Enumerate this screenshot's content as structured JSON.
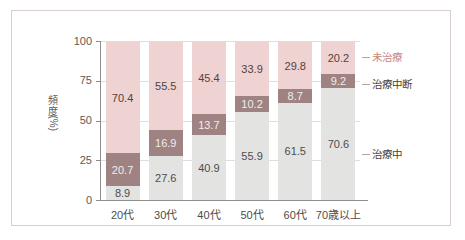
{
  "chart_data": {
    "type": "bar",
    "subtype": "100% stacked bar",
    "title": "",
    "xlabel": "",
    "ylabel": "頻度(%)",
    "ylabel_chars": [
      "頻",
      "度",
      "(%)"
    ],
    "ylim": [
      0,
      100
    ],
    "yticks": [
      0,
      25,
      50,
      75,
      100
    ],
    "ytick_labels": [
      "0",
      "25",
      "50",
      "75",
      "100"
    ],
    "grid": true,
    "legend_position": "right",
    "categories": [
      "20代",
      "30代",
      "40代",
      "50代",
      "60代",
      "70歳以上"
    ],
    "series": [
      {
        "name": "治療中",
        "key": "treating",
        "color": "#e3e3e1",
        "values": [
          8.9,
          27.6,
          40.9,
          55.9,
          61.5,
          70.6
        ]
      },
      {
        "name": "治療中断",
        "key": "interrupted",
        "color": "#9e8382",
        "values": [
          20.7,
          16.9,
          13.7,
          10.2,
          8.7,
          9.2
        ]
      },
      {
        "name": "未治療",
        "key": "untreated",
        "color": "#efd2d2",
        "values": [
          70.4,
          55.5,
          45.4,
          33.9,
          29.8,
          20.2
        ]
      }
    ],
    "legend": [
      {
        "label": "未治療",
        "color": "#efd2d2",
        "text_color": "#c8867f"
      },
      {
        "label": "治療中断",
        "color": "#9e8382",
        "text_color": "#4a4040"
      },
      {
        "label": "治療中",
        "color": "#e3e3e1",
        "text_color": "#4a4040"
      }
    ],
    "colors": {
      "untreated": "#efd2d2",
      "interrupted": "#9e8382",
      "treating": "#e3e3e1",
      "axis": "#8d8d8d",
      "grid": "#dedede",
      "frame": "#d9cfcf",
      "background": "#ffffff",
      "tick_text": "#5a5a5a"
    }
  }
}
